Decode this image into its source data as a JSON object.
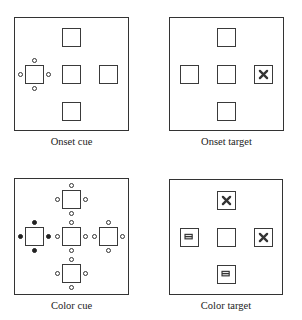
{
  "panels": [
    {
      "caption": "Onset cue",
      "frame": {
        "x": 14,
        "y": 17,
        "w": 115,
        "h": 114
      },
      "boxes": [
        {
          "pos": "top",
          "symbol": "none",
          "dots": "none"
        },
        {
          "pos": "left",
          "symbol": "none",
          "dots": "open"
        },
        {
          "pos": "center",
          "symbol": "none",
          "dots": "none"
        },
        {
          "pos": "right",
          "symbol": "none",
          "dots": "none"
        },
        {
          "pos": "bottom",
          "symbol": "none",
          "dots": "none"
        }
      ]
    },
    {
      "caption": "Onset target",
      "frame": {
        "x": 169,
        "y": 17,
        "w": 115,
        "h": 114
      },
      "boxes": [
        {
          "pos": "top",
          "symbol": "none",
          "dots": "none"
        },
        {
          "pos": "left",
          "symbol": "none",
          "dots": "none"
        },
        {
          "pos": "center",
          "symbol": "none",
          "dots": "none"
        },
        {
          "pos": "right",
          "symbol": "x",
          "dots": "none"
        },
        {
          "pos": "bottom",
          "symbol": "none",
          "dots": "none"
        }
      ]
    },
    {
      "caption": "Color cue",
      "frame": {
        "x": 14,
        "y": 178,
        "w": 115,
        "h": 117
      },
      "boxes": [
        {
          "pos": "top",
          "symbol": "none",
          "dots": "open"
        },
        {
          "pos": "left",
          "symbol": "none",
          "dots": "filled"
        },
        {
          "pos": "center",
          "symbol": "none",
          "dots": "open"
        },
        {
          "pos": "right",
          "symbol": "none",
          "dots": "open"
        },
        {
          "pos": "bottom",
          "symbol": "none",
          "dots": "open"
        }
      ]
    },
    {
      "caption": "Color target",
      "frame": {
        "x": 169,
        "y": 179,
        "w": 114,
        "h": 116
      },
      "boxes": [
        {
          "pos": "top",
          "symbol": "x",
          "dots": "none"
        },
        {
          "pos": "left",
          "symbol": "equals",
          "dots": "none"
        },
        {
          "pos": "center",
          "symbol": "none",
          "dots": "none"
        },
        {
          "pos": "right",
          "symbol": "x",
          "dots": "none"
        },
        {
          "pos": "bottom",
          "symbol": "equals",
          "dots": "none"
        }
      ]
    }
  ],
  "colors": {
    "line": "#333333",
    "background": "#ffffff",
    "text": "#222222"
  }
}
